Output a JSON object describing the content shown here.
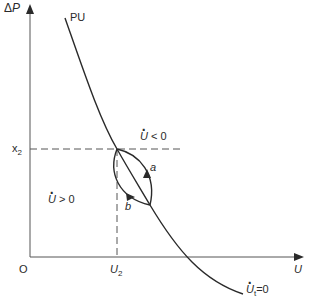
{
  "diagram": {
    "axes": {
      "y_label_prefix": "Δ",
      "y_label_var": "P",
      "x_label": "U",
      "origin_label": "O"
    },
    "ticks": {
      "y_tick_var": "x",
      "y_tick_sub": "2",
      "x_tick_var": "U",
      "x_tick_sub": "2"
    },
    "curve": {
      "top_label": "PU",
      "bottom_label_var": "U",
      "bottom_label_sub": "t",
      "bottom_label_eq": "=0"
    },
    "regions": {
      "upper_right_var": "U",
      "upper_right_rel": " < 0",
      "lower_left_var": "U",
      "lower_left_rel": " > 0"
    },
    "paths": {
      "a_label": "a",
      "b_label": "b"
    },
    "colors": {
      "line": "#2a2a2a",
      "axis": "#555555",
      "dash": "#555555",
      "background": "#ffffff"
    }
  }
}
